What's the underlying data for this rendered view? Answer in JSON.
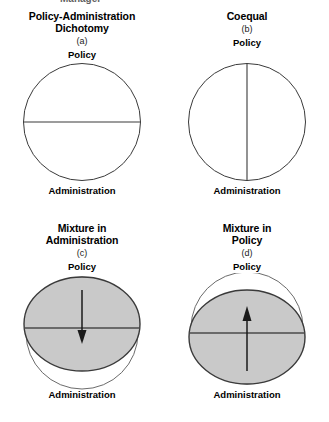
{
  "figure": {
    "top_cut_text": "Management",
    "background_color": "#ffffff",
    "line_color": "#3a3a3a",
    "fill_gray": "#c9c9c9",
    "fill_white": "#ffffff"
  },
  "panels": [
    {
      "id": "panel-a",
      "title": "Policy-Administration\nDichotomy",
      "letter": "(a)",
      "top_label": "Policy",
      "bottom_label": "Administration",
      "shape": "circle-with-horizontal-divider",
      "divider": "horizontal",
      "filled": false,
      "arrow": "none"
    },
    {
      "id": "panel-b",
      "title": "Coequal",
      "letter": "(b)",
      "top_label": "Policy",
      "bottom_label": "Administration",
      "shape": "circle-with-vertical-divider",
      "divider": "vertical",
      "filled": false,
      "arrow": "none"
    },
    {
      "id": "panel-c",
      "title": "Mixture in\nAdministration",
      "letter": "(c)",
      "top_label": "Policy",
      "bottom_label": "Administration",
      "shape": "circle-with-shifted-up-gray-ellipse",
      "divider": "horizontal",
      "filled": true,
      "arrow": "down"
    },
    {
      "id": "panel-d",
      "title": "Mixture in\nPolicy",
      "letter": "(d)",
      "top_label": "Policy",
      "bottom_label": "Administration",
      "shape": "circle-with-shifted-down-gray-ellipse",
      "divider": "horizontal",
      "filled": true,
      "arrow": "up"
    }
  ]
}
